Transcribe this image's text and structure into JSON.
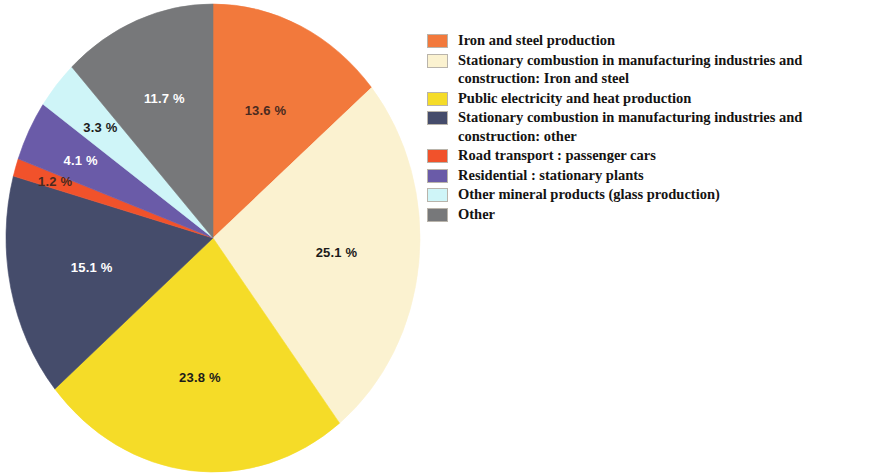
{
  "chart_data": {
    "type": "pie",
    "title": "",
    "subtitle": "",
    "xlabel": "",
    "ylabel": "",
    "legend_position": "right",
    "grid": false,
    "unit": "%",
    "start_angle_deg": 0,
    "direction": "clockwise",
    "categories": [
      "Iron and steel production",
      "Stationary combustion in manufacturing industries and construction: Iron and steel",
      "Public electricity and heat production",
      "Stationary combustion in manufacturing industries and construction: other",
      "Road transport : passenger cars",
      "Residential : stationary plants",
      "Other mineral products (glass production)",
      "Other"
    ],
    "values": [
      13.6,
      25.1,
      23.8,
      15.1,
      1.2,
      4.1,
      3.3,
      11.7
    ],
    "value_labels": [
      "13.6 %",
      "25.1 %",
      "23.8 %",
      "15.1 %",
      "1.2 %",
      "4.1 %",
      "3.3 %",
      "11.7 %"
    ],
    "colors": [
      "#F2793C",
      "#FBF2D0",
      "#F5DC28",
      "#454C6B",
      "#F1522B",
      "#6A5BA8",
      "#CFF5F8",
      "#77787A"
    ]
  },
  "legend": {
    "items": [
      {
        "label": "Iron and steel production",
        "color": "#F2793C"
      },
      {
        "label": "Stationary combustion in manufacturing industries and construction: Iron and steel",
        "color": "#FBF2D0"
      },
      {
        "label": "Public electricity and heat production",
        "color": "#F5DC28"
      },
      {
        "label": "Stationary combustion in manufacturing industries and construction: other",
        "color": "#454C6B"
      },
      {
        "label": "Road transport : passenger cars",
        "color": "#F1522B"
      },
      {
        "label": "Residential : stationary plants",
        "color": "#6A5BA8"
      },
      {
        "label": "Other mineral products (glass production)",
        "color": "#CFF5F8"
      },
      {
        "label": "Other",
        "color": "#77787A"
      }
    ]
  }
}
